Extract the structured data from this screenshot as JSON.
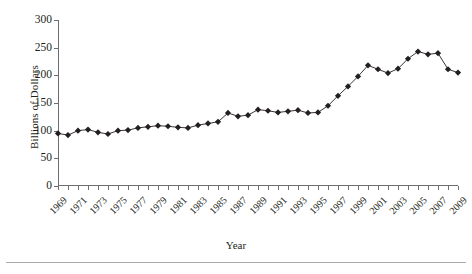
{
  "chart_data": {
    "type": "line",
    "title": "",
    "xlabel": "Year",
    "ylabel": "Billions of Dollars",
    "xlim": [
      1969,
      2009
    ],
    "ylim": [
      0,
      300
    ],
    "yticks": [
      0,
      50,
      100,
      150,
      200,
      250,
      300
    ],
    "xticks": [
      1969,
      1971,
      1973,
      1975,
      1977,
      1979,
      1981,
      1983,
      1985,
      1987,
      1989,
      1991,
      1993,
      1995,
      1997,
      1999,
      2001,
      2003,
      2005,
      2007,
      2009
    ],
    "grid": false,
    "legend": null,
    "marker": "diamond",
    "marker_color": "#231f20",
    "line_color": "#231f20",
    "x": [
      1969,
      1970,
      1971,
      1972,
      1973,
      1974,
      1975,
      1976,
      1977,
      1978,
      1979,
      1980,
      1981,
      1982,
      1983,
      1984,
      1985,
      1986,
      1987,
      1988,
      1989,
      1990,
      1991,
      1992,
      1993,
      1994,
      1995,
      1996,
      1997,
      1998,
      1999,
      2000,
      2001,
      2002,
      2003,
      2004,
      2005,
      2006,
      2007,
      2008,
      2009
    ],
    "values": [
      95,
      92,
      100,
      102,
      97,
      94,
      100,
      101,
      105,
      107,
      109,
      108,
      106,
      105,
      110,
      113,
      116,
      132,
      126,
      128,
      138,
      136,
      133,
      135,
      137,
      132,
      133,
      145,
      163,
      180,
      198,
      218,
      211,
      204,
      212,
      230,
      243,
      238,
      240,
      211,
      205
    ],
    "ylabel_unit": "Billions of Dollars"
  },
  "axes": {
    "y_title": "Billions of Dollars",
    "x_title": "Year"
  }
}
